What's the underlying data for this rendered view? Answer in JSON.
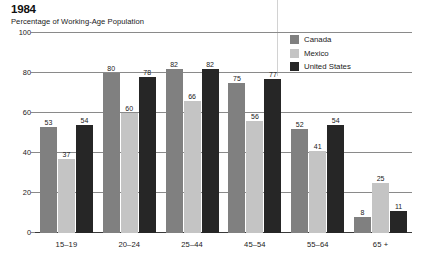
{
  "header": {
    "title": "1984",
    "subtitle": "Percentage of Working-Age Population"
  },
  "legend": {
    "items": [
      {
        "label": "Canada",
        "color": "#808080"
      },
      {
        "label": "Mexico",
        "color": "#c4c4c4"
      },
      {
        "label": "United States",
        "color": "#262626"
      }
    ]
  },
  "chart_data": {
    "type": "bar",
    "title": "1984",
    "subtitle": "Percentage of Working-Age Population",
    "xlabel": "",
    "ylabel": "",
    "ylim": [
      0,
      100
    ],
    "yticks": [
      0,
      20,
      40,
      60,
      80,
      100
    ],
    "grid": true,
    "legend_position": "top-right",
    "categories": [
      "15–19",
      "20–24",
      "25–44",
      "45–54",
      "55–64",
      "65 +"
    ],
    "series": [
      {
        "name": "Canada",
        "color": "#808080",
        "values": [
          53,
          80,
          82,
          75,
          52,
          8
        ]
      },
      {
        "name": "Mexico",
        "color": "#c4c4c4",
        "values": [
          37,
          60,
          66,
          56,
          41,
          25
        ]
      },
      {
        "name": "United States",
        "color": "#262626",
        "values": [
          54,
          78,
          82,
          77,
          54,
          11
        ]
      }
    ]
  }
}
